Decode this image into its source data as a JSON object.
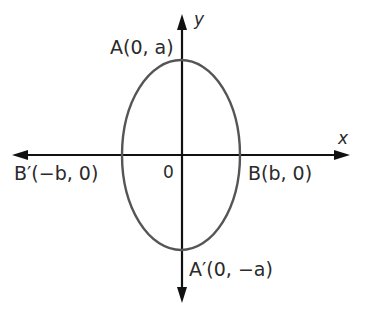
{
  "diagram": {
    "type": "ellipse-on-axes",
    "colors": {
      "axis": "#111111",
      "ellipse": "#555555",
      "text": "#2a2a2a",
      "background": "#ffffff"
    },
    "axes": {
      "x_label": "x",
      "y_label": "y",
      "origin_label": "0"
    },
    "points": {
      "A": "A(0, a)",
      "A_prime": "A′(0, −a)",
      "B": "B(b, 0)",
      "B_prime": "B′(−b, 0)"
    }
  }
}
